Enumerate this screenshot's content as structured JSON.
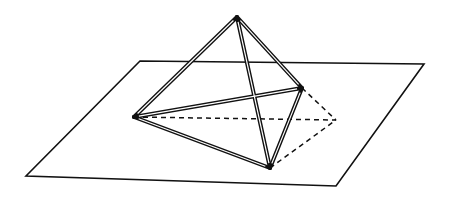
{
  "figure": {
    "colors": {
      "stroke": "#111111",
      "background": "#ffffff"
    },
    "plane": {
      "corners": [
        [
          140,
          61
        ],
        [
          424,
          64
        ],
        [
          336,
          186
        ],
        [
          26,
          176
        ]
      ]
    },
    "vertices": {
      "apex": [
        237,
        17
      ],
      "left": [
        134,
        117
      ],
      "right": [
        302,
        88
      ],
      "bottom": [
        270,
        168
      ],
      "hidden": [
        336,
        120
      ]
    },
    "solid_edges": [
      [
        "apex",
        "left"
      ],
      [
        "apex",
        "right"
      ],
      [
        "apex",
        "bottom"
      ],
      [
        "left",
        "right"
      ],
      [
        "left",
        "bottom"
      ],
      [
        "right",
        "bottom"
      ]
    ],
    "hidden_edges": [
      [
        "left",
        "hidden"
      ],
      [
        "right",
        "hidden"
      ],
      [
        "bottom",
        "hidden"
      ]
    ]
  }
}
